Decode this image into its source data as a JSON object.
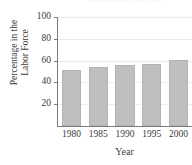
{
  "chart_data": {
    "type": "bar",
    "title": "Women in the Labor Force",
    "xlabel": "Year",
    "ylabel_line1": "Percentage in the",
    "ylabel_line2": "Labor Force",
    "categories": [
      "1980",
      "1985",
      "1990",
      "1995",
      "2000"
    ],
    "values": [
      51,
      54,
      56,
      57,
      61
    ],
    "ylim": [
      0,
      100
    ],
    "yticks": [
      "20",
      "40",
      "60",
      "80",
      "100"
    ],
    "ytick_values": [
      20,
      40,
      60,
      80,
      100
    ],
    "grid": true,
    "legend": "none",
    "bar_color": "#bfbfbf",
    "axis_color": "#7a7a7a",
    "grid_color": "#ececec",
    "text_color": "#3b3b3b"
  }
}
